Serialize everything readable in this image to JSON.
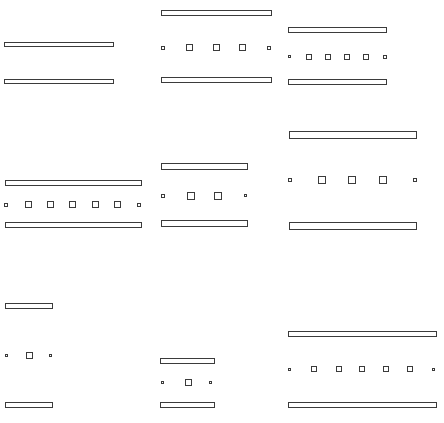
{
  "canvas": {
    "width": 444,
    "height": 423,
    "background": "#ffffff",
    "stroke": "#3b3b3b",
    "fill": "#ffffff"
  },
  "figures": [
    {
      "name": "top-left",
      "bars": [
        {
          "x": 4,
          "y": 42,
          "w": 110,
          "h": 5
        },
        {
          "x": 4,
          "y": 79,
          "w": 110,
          "h": 5
        }
      ],
      "markers": []
    },
    {
      "name": "top-middle",
      "bars": [
        {
          "x": 161,
          "y": 10,
          "w": 111,
          "h": 6
        },
        {
          "x": 161,
          "y": 77,
          "w": 111,
          "h": 6
        }
      ],
      "markers": [
        {
          "type": "tiny",
          "x": 161,
          "y": 46,
          "s": 4
        },
        {
          "type": "square",
          "x": 186,
          "y": 44,
          "s": 7
        },
        {
          "type": "square",
          "x": 213,
          "y": 44,
          "s": 7
        },
        {
          "type": "square",
          "x": 239,
          "y": 44,
          "s": 7
        },
        {
          "type": "tiny",
          "x": 267,
          "y": 46,
          "s": 4
        }
      ]
    },
    {
      "name": "top-right",
      "bars": [
        {
          "x": 288,
          "y": 27,
          "w": 99,
          "h": 6
        },
        {
          "x": 288,
          "y": 79,
          "w": 99,
          "h": 6
        }
      ],
      "markers": [
        {
          "type": "tiny",
          "x": 288,
          "y": 55,
          "s": 3
        },
        {
          "type": "square",
          "x": 306,
          "y": 54,
          "s": 6
        },
        {
          "type": "square",
          "x": 325,
          "y": 54,
          "s": 6
        },
        {
          "type": "square",
          "x": 344,
          "y": 54,
          "s": 6
        },
        {
          "type": "square",
          "x": 363,
          "y": 54,
          "s": 6
        },
        {
          "type": "tiny",
          "x": 383,
          "y": 55,
          "s": 4
        }
      ]
    },
    {
      "name": "middle-left",
      "bars": [
        {
          "x": 5,
          "y": 180,
          "w": 137,
          "h": 6
        },
        {
          "x": 5,
          "y": 222,
          "w": 137,
          "h": 6
        }
      ],
      "markers": [
        {
          "type": "tiny",
          "x": 4,
          "y": 203,
          "s": 4
        },
        {
          "type": "square",
          "x": 25,
          "y": 201,
          "s": 7
        },
        {
          "type": "square",
          "x": 47,
          "y": 201,
          "s": 7
        },
        {
          "type": "square",
          "x": 69,
          "y": 201,
          "s": 7
        },
        {
          "type": "square",
          "x": 92,
          "y": 201,
          "s": 7
        },
        {
          "type": "square",
          "x": 114,
          "y": 201,
          "s": 7
        },
        {
          "type": "tiny",
          "x": 137,
          "y": 203,
          "s": 4
        }
      ]
    },
    {
      "name": "middle-middle",
      "bars": [
        {
          "x": 161,
          "y": 163,
          "w": 87,
          "h": 7
        },
        {
          "x": 161,
          "y": 220,
          "w": 87,
          "h": 7
        }
      ],
      "markers": [
        {
          "type": "tiny",
          "x": 161,
          "y": 194,
          "s": 4
        },
        {
          "type": "square",
          "x": 187,
          "y": 192,
          "s": 8
        },
        {
          "type": "square",
          "x": 214,
          "y": 192,
          "s": 8
        },
        {
          "type": "tiny",
          "x": 244,
          "y": 194,
          "s": 3
        }
      ]
    },
    {
      "name": "middle-right",
      "bars": [
        {
          "x": 289,
          "y": 131,
          "w": 128,
          "h": 8
        },
        {
          "x": 289,
          "y": 222,
          "w": 128,
          "h": 8
        }
      ],
      "markers": [
        {
          "type": "tiny",
          "x": 288,
          "y": 178,
          "s": 4
        },
        {
          "type": "square",
          "x": 318,
          "y": 176,
          "s": 8
        },
        {
          "type": "square",
          "x": 348,
          "y": 176,
          "s": 8
        },
        {
          "type": "square",
          "x": 379,
          "y": 176,
          "s": 8
        },
        {
          "type": "tiny",
          "x": 413,
          "y": 178,
          "s": 4
        }
      ]
    },
    {
      "name": "bottom-left",
      "bars": [
        {
          "x": 5,
          "y": 303,
          "w": 48,
          "h": 6
        },
        {
          "x": 5,
          "y": 402,
          "w": 48,
          "h": 6
        }
      ],
      "markers": [
        {
          "type": "tiny",
          "x": 5,
          "y": 354,
          "s": 3
        },
        {
          "type": "square",
          "x": 26,
          "y": 352,
          "s": 7
        },
        {
          "type": "tiny",
          "x": 49,
          "y": 354,
          "s": 3
        }
      ]
    },
    {
      "name": "bottom-middle",
      "bars": [
        {
          "x": 160,
          "y": 358,
          "w": 55,
          "h": 6
        },
        {
          "x": 160,
          "y": 402,
          "w": 55,
          "h": 6
        }
      ],
      "markers": [
        {
          "type": "tiny",
          "x": 161,
          "y": 381,
          "s": 3
        },
        {
          "type": "square",
          "x": 185,
          "y": 379,
          "s": 7
        },
        {
          "type": "tiny",
          "x": 209,
          "y": 381,
          "s": 3
        }
      ]
    },
    {
      "name": "bottom-right",
      "bars": [
        {
          "x": 288,
          "y": 331,
          "w": 149,
          "h": 6
        },
        {
          "x": 288,
          "y": 402,
          "w": 149,
          "h": 6
        }
      ],
      "markers": [
        {
          "type": "tiny",
          "x": 288,
          "y": 368,
          "s": 3
        },
        {
          "type": "square",
          "x": 311,
          "y": 366,
          "s": 6
        },
        {
          "type": "square",
          "x": 336,
          "y": 366,
          "s": 6
        },
        {
          "type": "square",
          "x": 359,
          "y": 366,
          "s": 6
        },
        {
          "type": "square",
          "x": 383,
          "y": 366,
          "s": 6
        },
        {
          "type": "square",
          "x": 407,
          "y": 366,
          "s": 6
        },
        {
          "type": "tiny",
          "x": 432,
          "y": 368,
          "s": 3
        }
      ]
    }
  ]
}
